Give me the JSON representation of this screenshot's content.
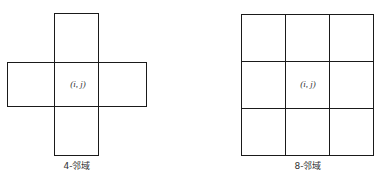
{
  "figures": [
    {
      "name": "4-neighborhood",
      "center_label": "(i, j)",
      "caption": "4-邻域"
    },
    {
      "name": "8-neighborhood",
      "center_label": "(i, j)",
      "caption": "8-邻域"
    }
  ]
}
